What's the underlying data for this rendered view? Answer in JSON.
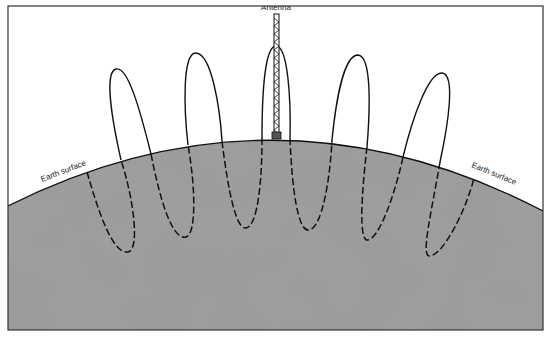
{
  "diagram": {
    "labels": {
      "antenna": "Antenna",
      "earth_surface_left": "Earth surface",
      "earth_surface_right": "Earth surface"
    },
    "colors": {
      "sky": "#ffffff",
      "earth": "#9a9a9a",
      "line": "#111111",
      "frame": "#333333"
    },
    "loop_count": 5
  }
}
